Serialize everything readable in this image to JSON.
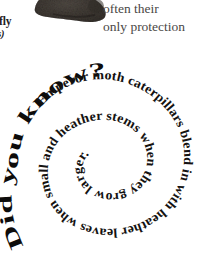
{
  "page": {
    "background_color": "#ffffff",
    "width": 207,
    "height": 256
  },
  "caption": {
    "common_name": "tterfly",
    "latin_name": "ocus)",
    "text_color": "#23201e"
  },
  "body_text": {
    "line1": "often their",
    "line2": "only protection",
    "text_color": "#4a4846"
  },
  "photo": {
    "subject": "caterpillar-photograph",
    "base_color": "#4e4843",
    "shadow_color": "#2a2622",
    "highlight_color": "#8d857c"
  },
  "spiral": {
    "outer_label": "Did you know?",
    "fact_text": "Emperor moth caterpillars blend in with heather leaves when small and heather stems when they grow larger.",
    "text_color": "#0d0c0b",
    "center_x": 112,
    "center_y": 95,
    "turns": 2.6
  }
}
